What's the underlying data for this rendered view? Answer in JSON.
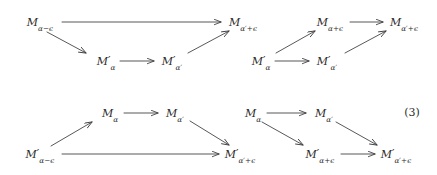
{
  "figure": {
    "kind": "commutative-diagram",
    "equation_number": "(3)",
    "background_color": "#ffffff",
    "ink_color": "#2b2b2b",
    "diagrams": [
      {
        "id": "top-diagram",
        "nodes": [
          {
            "id": "t1",
            "base": "M",
            "prime": "",
            "sub_alpha": "α",
            "sub_op": "−",
            "sub_eps": "ϵ",
            "x": 40,
            "y": 22
          },
          {
            "id": "t2",
            "base": "M",
            "prime": "′",
            "sub_alpha": "α",
            "sub_op": "",
            "sub_eps": "",
            "x": 106,
            "y": 61
          },
          {
            "id": "t3",
            "base": "M",
            "prime": "′",
            "sub_alpha": "α",
            "sub_op": "",
            "sub_eps": "",
            "x": 172,
            "y": 61,
            "alpha_prime": "′"
          },
          {
            "id": "t4",
            "base": "M",
            "prime": "",
            "sub_alpha": "α",
            "sub_op": "+",
            "sub_eps": "ϵ",
            "x": 243,
            "y": 22,
            "alpha_prime": "′"
          },
          {
            "id": "t5",
            "base": "M",
            "prime": "′",
            "sub_alpha": "α",
            "sub_op": "",
            "sub_eps": "",
            "x": 261,
            "y": 61
          },
          {
            "id": "t6",
            "base": "M",
            "prime": "′",
            "sub_alpha": "α",
            "sub_op": "",
            "sub_eps": "",
            "x": 327,
            "y": 61,
            "alpha_prime": "′"
          },
          {
            "id": "t7",
            "base": "M",
            "prime": "",
            "sub_alpha": "α",
            "sub_op": "+",
            "sub_eps": "ϵ",
            "x": 330,
            "y": 22
          },
          {
            "id": "t8",
            "base": "M",
            "prime": "",
            "sub_alpha": "α",
            "sub_op": "+",
            "sub_eps": "ϵ",
            "x": 404,
            "y": 22,
            "alpha_prime": "′"
          }
        ],
        "labels": [
          "M_{α−ϵ}",
          "M'_{α}",
          "M'_{α'}",
          "M_{α'+ϵ}",
          "M'_{α}",
          "M'_{α'}",
          "M_{α+ϵ}",
          "M_{α'+ϵ}"
        ],
        "edges": [
          {
            "from": "t1",
            "to": "t4",
            "style": "horizontal"
          },
          {
            "from": "t1",
            "to": "t2",
            "style": "diagonal-down"
          },
          {
            "from": "t2",
            "to": "t3",
            "style": "horizontal"
          },
          {
            "from": "t3",
            "to": "t4",
            "style": "diagonal-up"
          },
          {
            "from": "t5",
            "to": "t7",
            "style": "diagonal-up"
          },
          {
            "from": "t5",
            "to": "t6",
            "style": "horizontal"
          },
          {
            "from": "t7",
            "to": "t8",
            "style": "horizontal"
          },
          {
            "from": "t6",
            "to": "t8",
            "style": "diagonal-up"
          }
        ]
      },
      {
        "id": "bottom-diagram",
        "nodes": [
          {
            "id": "b1",
            "base": "M",
            "prime": "′",
            "sub_alpha": "α",
            "sub_op": "−",
            "sub_eps": "ϵ",
            "x": 40,
            "y": 154
          },
          {
            "id": "b2",
            "base": "M",
            "prime": "",
            "sub_alpha": "α",
            "sub_op": "",
            "sub_eps": "",
            "x": 110,
            "y": 113
          },
          {
            "id": "b3",
            "base": "M",
            "prime": "",
            "sub_alpha": "α",
            "sub_op": "",
            "sub_eps": "",
            "x": 175,
            "y": 113,
            "alpha_prime": "′"
          },
          {
            "id": "b4",
            "base": "M",
            "prime": "′",
            "sub_alpha": "α",
            "sub_op": "+",
            "sub_eps": "ϵ",
            "x": 240,
            "y": 154,
            "alpha_prime": "′"
          },
          {
            "id": "b5",
            "base": "M",
            "prime": "",
            "sub_alpha": "α",
            "sub_op": "",
            "sub_eps": "",
            "x": 253,
            "y": 113
          },
          {
            "id": "b6",
            "base": "M",
            "prime": "",
            "sub_alpha": "α",
            "sub_op": "",
            "sub_eps": "",
            "x": 324,
            "y": 113,
            "alpha_prime": "′"
          },
          {
            "id": "b7",
            "base": "M",
            "prime": "′",
            "sub_alpha": "α",
            "sub_op": "+",
            "sub_eps": "ϵ",
            "x": 320,
            "y": 154
          },
          {
            "id": "b8",
            "base": "M",
            "prime": "′",
            "sub_alpha": "α",
            "sub_op": "+",
            "sub_eps": "ϵ",
            "x": 396,
            "y": 154,
            "alpha_prime": "′"
          }
        ],
        "labels": [
          "M'_{α−ϵ}",
          "M_{α}",
          "M_{α'}",
          "M'_{α'+ϵ}",
          "M_{α}",
          "M_{α'}",
          "M'_{α+ϵ}",
          "M'_{α'+ϵ}"
        ],
        "edges": [
          {
            "from": "b1",
            "to": "b2",
            "style": "diagonal-up"
          },
          {
            "from": "b2",
            "to": "b3",
            "style": "horizontal"
          },
          {
            "from": "b1",
            "to": "b4",
            "style": "horizontal"
          },
          {
            "from": "b3",
            "to": "b4",
            "style": "diagonal-down"
          },
          {
            "from": "b5",
            "to": "b6",
            "style": "horizontal"
          },
          {
            "from": "b5",
            "to": "b7",
            "style": "diagonal-down"
          },
          {
            "from": "b7",
            "to": "b8",
            "style": "horizontal"
          },
          {
            "from": "b6",
            "to": "b8",
            "style": "diagonal-down"
          }
        ]
      }
    ]
  }
}
